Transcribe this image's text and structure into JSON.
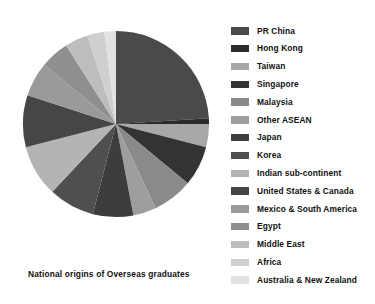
{
  "chart_data": {
    "type": "pie",
    "title": "National origins of Overseas graduates",
    "xlabel": "",
    "ylabel": "",
    "legend_position": "right",
    "grid": false,
    "start_angle_deg": 0,
    "direction": "clockwise",
    "categories": [
      "PR China",
      "Hong Kong",
      "Taiwan",
      "Singapore",
      "Malaysia",
      "Other ASEAN",
      "Japan",
      "Korea",
      "Indian sub-continent",
      "United States & Canada",
      "Mexico & South America",
      "Egypt",
      "Middle East",
      "Africa",
      "Australia & New Zealand"
    ],
    "values": [
      24,
      1,
      4,
      7,
      7,
      4,
      7,
      8,
      9,
      9,
      6,
      5,
      4,
      3,
      2
    ],
    "colors": [
      "#4a4a4a",
      "#2b2b2b",
      "#a8a8a8",
      "#333333",
      "#8a8a8a",
      "#9e9e9e",
      "#3d3d3d",
      "#4f4f4f",
      "#b4b4b4",
      "#464646",
      "#9a9a9a",
      "#8f8f8f",
      "#bdbdbd",
      "#cfcfcf",
      "#e2e2e2"
    ]
  },
  "legend": {
    "items": [
      {
        "label": "PR China",
        "color": "#4a4a4a"
      },
      {
        "label": "Hong Kong",
        "color": "#2b2b2b"
      },
      {
        "label": "Taiwan",
        "color": "#a8a8a8"
      },
      {
        "label": "Singapore",
        "color": "#333333"
      },
      {
        "label": "Malaysia",
        "color": "#8a8a8a"
      },
      {
        "label": "Other ASEAN",
        "color": "#9e9e9e"
      },
      {
        "label": "Japan",
        "color": "#3d3d3d"
      },
      {
        "label": "Korea",
        "color": "#4f4f4f"
      },
      {
        "label": "Indian sub-continent",
        "color": "#b4b4b4"
      },
      {
        "label": "United States & Canada",
        "color": "#464646"
      },
      {
        "label": "Mexico & South America",
        "color": "#9a9a9a"
      },
      {
        "label": "Egypt",
        "color": "#8f8f8f"
      },
      {
        "label": "Middle East",
        "color": "#bdbdbd"
      },
      {
        "label": "Africa",
        "color": "#cfcfcf"
      },
      {
        "label": "Australia & New Zealand",
        "color": "#e2e2e2"
      }
    ]
  }
}
